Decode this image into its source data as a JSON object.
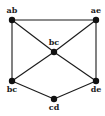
{
  "diagram": {
    "type": "graph",
    "nodes": [
      {
        "id": "n1",
        "label": "ab",
        "x": 12,
        "y": 20,
        "lx": 12,
        "ly": 13
      },
      {
        "id": "n2",
        "label": "ae",
        "x": 96,
        "y": 20,
        "lx": 96,
        "ly": 13
      },
      {
        "id": "n3",
        "label": "bc",
        "x": 54,
        "y": 52,
        "lx": 54,
        "ly": 45
      },
      {
        "id": "n4",
        "label": "bc",
        "x": 12,
        "y": 81,
        "lx": 12,
        "ly": 92
      },
      {
        "id": "n5",
        "label": "de",
        "x": 96,
        "y": 81,
        "lx": 96,
        "ly": 92
      },
      {
        "id": "n6",
        "label": "cd",
        "x": 54,
        "y": 99,
        "lx": 54,
        "ly": 110
      }
    ],
    "edges": [
      [
        "n1",
        "n2"
      ],
      [
        "n1",
        "n4"
      ],
      [
        "n2",
        "n5"
      ],
      [
        "n1",
        "n3"
      ],
      [
        "n2",
        "n3"
      ],
      [
        "n3",
        "n4"
      ],
      [
        "n3",
        "n5"
      ],
      [
        "n4",
        "n6"
      ],
      [
        "n5",
        "n6"
      ]
    ],
    "colors": {
      "edge": "#1a1a1a",
      "node": "#111111"
    }
  }
}
